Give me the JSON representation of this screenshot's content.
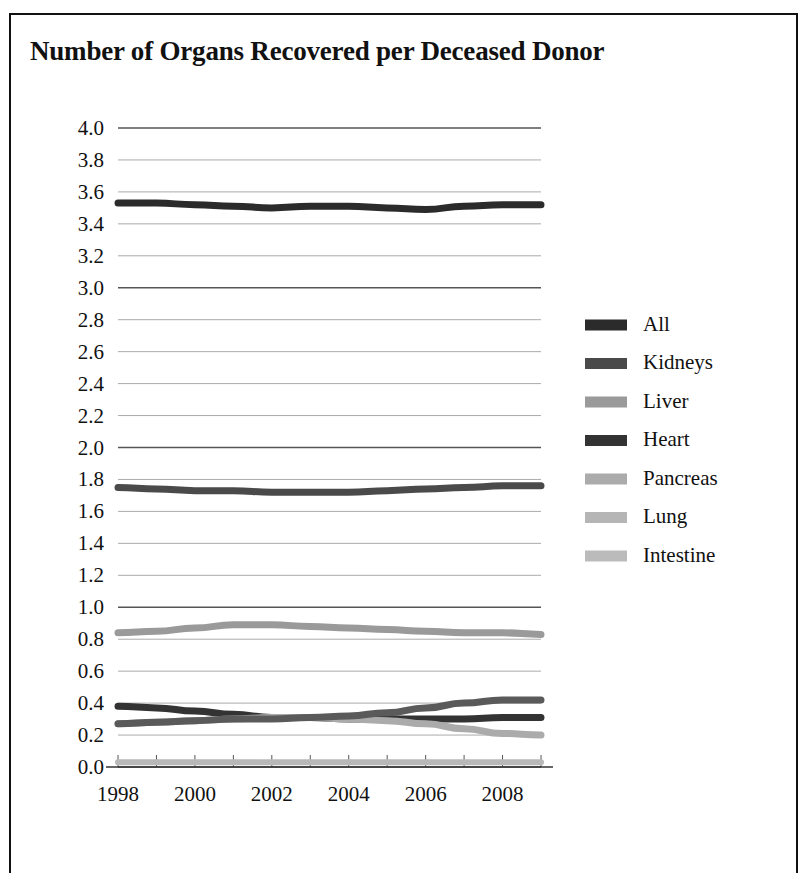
{
  "chart_data": {
    "type": "line",
    "title": "Number of Organs Recovered per Deceased Donor",
    "xlabel": "",
    "ylabel": "",
    "x": [
      1998,
      1999,
      2000,
      2001,
      2002,
      2003,
      2004,
      2005,
      2006,
      2007,
      2008,
      2009
    ],
    "tick_labels_x": [
      "1998",
      "2000",
      "2002",
      "2004",
      "2006",
      "2008"
    ],
    "tick_values_x": [
      1998,
      2000,
      2002,
      2004,
      2006,
      2008
    ],
    "tick_labels_y": [
      "0.0",
      "0.2",
      "0.4",
      "0.6",
      "0.8",
      "1.0",
      "1.2",
      "1.4",
      "1.6",
      "1.8",
      "2.0",
      "2.2",
      "2.4",
      "2.6",
      "2.8",
      "3.0",
      "3.2",
      "3.4",
      "3.6",
      "3.8",
      "4.0"
    ],
    "ylim": [
      0.0,
      4.0
    ],
    "xlim": [
      1998,
      2009
    ],
    "ytick_step": 0.2,
    "grid": true,
    "legend_position": "right",
    "series": [
      {
        "name": "All",
        "color": "#2b2b2b",
        "width": 7,
        "values": [
          3.53,
          3.53,
          3.52,
          3.51,
          3.5,
          3.51,
          3.51,
          3.5,
          3.49,
          3.51,
          3.52,
          3.52
        ]
      },
      {
        "name": "Kidneys",
        "color": "#4a4a4a",
        "width": 7,
        "values": [
          1.75,
          1.74,
          1.73,
          1.73,
          1.72,
          1.72,
          1.72,
          1.73,
          1.74,
          1.75,
          1.76,
          1.76
        ]
      },
      {
        "name": "Liver",
        "color": "#9a9a9a",
        "width": 7,
        "values": [
          0.84,
          0.85,
          0.87,
          0.89,
          0.89,
          0.88,
          0.87,
          0.86,
          0.85,
          0.84,
          0.84,
          0.83
        ]
      },
      {
        "name": "Heart",
        "color": "#333333",
        "width": 7,
        "values": [
          0.38,
          0.37,
          0.35,
          0.33,
          0.31,
          0.31,
          0.3,
          0.3,
          0.3,
          0.3,
          0.31,
          0.31
        ]
      },
      {
        "name": "Pancreas",
        "color": "#ababab",
        "width": 7,
        "values": [
          0.27,
          0.28,
          0.29,
          0.3,
          0.31,
          0.31,
          0.3,
          0.29,
          0.27,
          0.24,
          0.21,
          0.2
        ]
      },
      {
        "name": "Lung",
        "color": "#5a5a5a",
        "width": 7,
        "values": [
          0.27,
          0.28,
          0.29,
          0.3,
          0.3,
          0.31,
          0.32,
          0.34,
          0.37,
          0.4,
          0.42,
          0.42
        ]
      },
      {
        "name": "Intestine",
        "color": "#b8b8b8",
        "width": 6,
        "values": [
          0.03,
          0.03,
          0.03,
          0.03,
          0.03,
          0.03,
          0.03,
          0.03,
          0.03,
          0.03,
          0.03,
          0.03
        ]
      }
    ],
    "legend": [
      {
        "label": "All",
        "color": "#2b2b2b"
      },
      {
        "label": "Kidneys",
        "color": "#4a4a4a"
      },
      {
        "label": "Liver",
        "color": "#9a9a9a"
      },
      {
        "label": "Heart",
        "color": "#333333"
      },
      {
        "label": "Pancreas",
        "color": "#ababab"
      },
      {
        "label": "Lung",
        "color": "#b5b5b5"
      },
      {
        "label": "Intestine",
        "color": "#bbbbbb"
      }
    ]
  }
}
